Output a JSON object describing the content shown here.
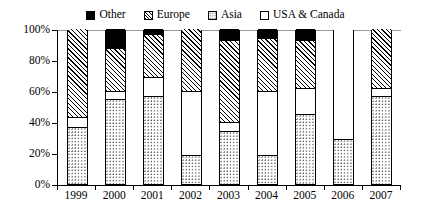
{
  "legend": {
    "position": "top-center",
    "entries": [
      {
        "label": "Other",
        "pattern": "solid-black",
        "swatch_class": "fill-other"
      },
      {
        "label": "Europe",
        "pattern": "diagonal-hatch",
        "swatch_class": "fill-europe"
      },
      {
        "label": "Asia",
        "pattern": "dotted",
        "swatch_class": "fill-asia"
      },
      {
        "label": "USA & Canada",
        "pattern": "white",
        "swatch_class": "fill-usa"
      }
    ]
  },
  "axes": {
    "y_ticks": [
      "0%",
      "20%",
      "40%",
      "60%",
      "80%",
      "100%"
    ],
    "x_ticks": [
      "1999",
      "2000",
      "2001",
      "2002",
      "2003",
      "2004",
      "2005",
      "2006",
      "2007"
    ]
  },
  "chart_data": {
    "type": "bar",
    "subtype": "stacked-100-percent",
    "title": "",
    "xlabel": "",
    "ylabel": "",
    "ylim": [
      0,
      100
    ],
    "yticks": [
      0,
      20,
      40,
      60,
      80,
      100
    ],
    "ytick_labels": [
      "0%",
      "20%",
      "40%",
      "60%",
      "80%",
      "100%"
    ],
    "grid": false,
    "legend_position": "top-center",
    "categories": [
      "1999",
      "2000",
      "2001",
      "2002",
      "2003",
      "2004",
      "2005",
      "2006",
      "2007"
    ],
    "stack_order_bottom_to_top": [
      "Asia",
      "USA & Canada",
      "Europe",
      "Other"
    ],
    "series": [
      {
        "name": "Asia",
        "pattern": "dotted",
        "values": [
          37,
          55,
          57,
          19,
          34,
          19,
          45,
          29,
          57
        ]
      },
      {
        "name": "USA & Canada",
        "pattern": "white",
        "values": [
          6,
          5,
          12,
          41,
          6,
          41,
          17,
          71,
          5
        ]
      },
      {
        "name": "Europe",
        "pattern": "diagonal-hatch",
        "values": [
          57,
          28,
          28,
          40,
          53,
          34,
          31,
          0,
          38
        ]
      },
      {
        "name": "Other",
        "pattern": "solid-black",
        "values": [
          0,
          12,
          3,
          0,
          7,
          6,
          7,
          0,
          0
        ]
      }
    ]
  }
}
